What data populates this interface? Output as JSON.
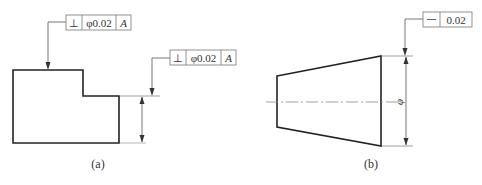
{
  "figure_a": {
    "caption": "(a)",
    "frame_top": {
      "symbol": "⊥",
      "symbol_name": "perpendicularity",
      "tolerance": "φ0.02",
      "datum": "A"
    },
    "frame_right": {
      "symbol": "⊥",
      "symbol_name": "perpendicularity",
      "tolerance": "φ0.02",
      "datum": "A"
    }
  },
  "figure_b": {
    "caption": "(b)",
    "frame": {
      "symbol": "—",
      "symbol_name": "straightness",
      "tolerance": "0.02"
    },
    "dimension_symbol": "φ"
  },
  "colors": {
    "outline": "#222222",
    "thin_line": "#555555",
    "frame_border": "#777777",
    "centerline": "#888888"
  }
}
